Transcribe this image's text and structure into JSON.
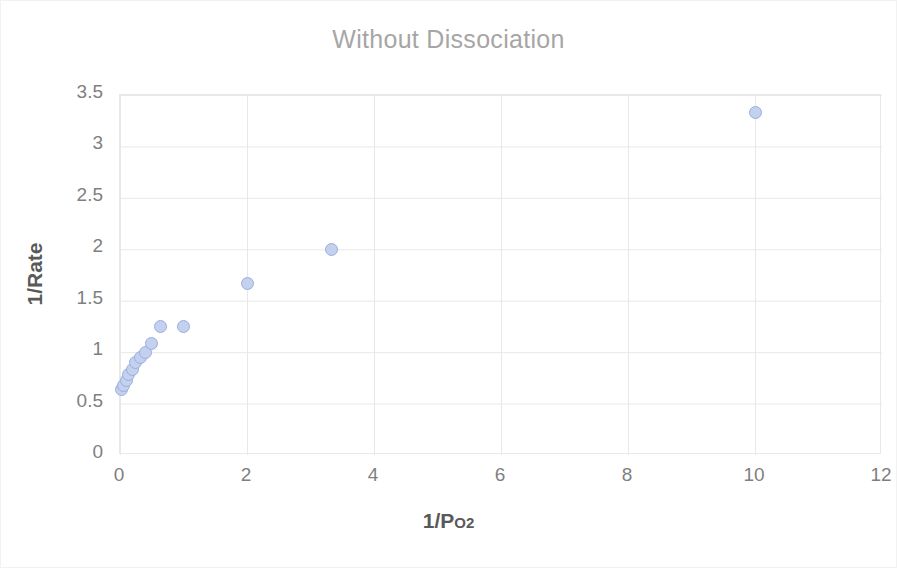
{
  "chart_data": {
    "type": "scatter",
    "title": "Without Dissociation",
    "xlabel_main": "1/P",
    "xlabel_sub": "O2",
    "xlabel": "1/Po2",
    "ylabel": "1/Rate",
    "xlim": [
      0,
      12
    ],
    "ylim": [
      0,
      3.5
    ],
    "xticks": [
      "0",
      "2",
      "4",
      "6",
      "8",
      "10",
      "12"
    ],
    "xtick_values": [
      0,
      2,
      4,
      6,
      8,
      10,
      12
    ],
    "yticks": [
      "0",
      "0.5",
      "1",
      "1.5",
      "2",
      "2.5",
      "3",
      "3.5"
    ],
    "ytick_values": [
      0,
      0.5,
      1,
      1.5,
      2,
      2.5,
      3,
      3.5
    ],
    "grid": true,
    "legend": "none",
    "series": [
      {
        "name": "1/Rate vs 1/Po2",
        "marker": "circle",
        "marker_fill": "#c3d0ee",
        "marker_edge": "#9aafdf",
        "points": [
          {
            "x": 0.02,
            "y": 0.64
          },
          {
            "x": 0.05,
            "y": 0.68
          },
          {
            "x": 0.1,
            "y": 0.72
          },
          {
            "x": 0.14,
            "y": 0.78
          },
          {
            "x": 0.2,
            "y": 0.83
          },
          {
            "x": 0.25,
            "y": 0.9
          },
          {
            "x": 0.33,
            "y": 0.95
          },
          {
            "x": 0.4,
            "y": 1.0
          },
          {
            "x": 0.5,
            "y": 1.08
          },
          {
            "x": 0.63,
            "y": 1.25
          },
          {
            "x": 1.0,
            "y": 1.25
          },
          {
            "x": 2.0,
            "y": 1.67
          },
          {
            "x": 3.33,
            "y": 2.0
          },
          {
            "x": 10.0,
            "y": 3.33
          }
        ]
      }
    ]
  },
  "colors": {
    "title": "#a6a6a6",
    "tick_text": "#7f7f7f",
    "axis_title": "#595959",
    "grid": "#e8e8e8",
    "marker_fill": "#c3d0ee",
    "marker_edge": "#9aafdf",
    "background": "#ffffff"
  }
}
